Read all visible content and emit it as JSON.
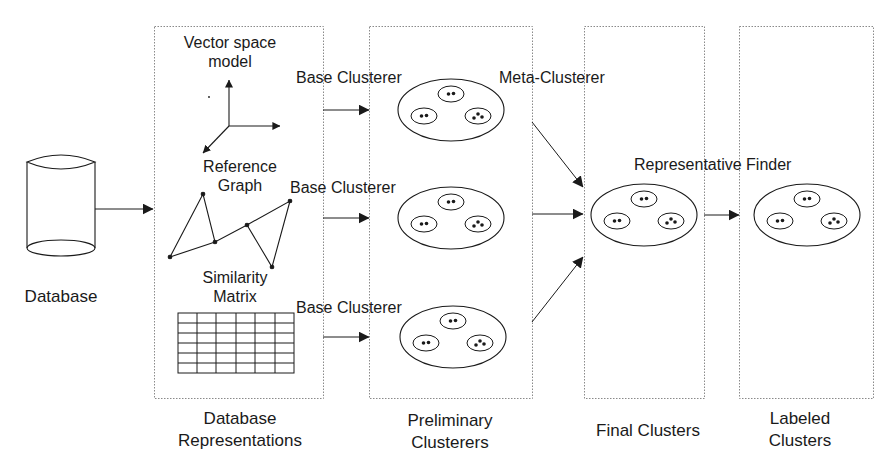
{
  "source": {
    "label": "Database",
    "icon": "database-cylinder-icon"
  },
  "stages": [
    {
      "id": "representations",
      "label_line1": "Database",
      "label_line2": "Representations",
      "items": [
        {
          "label_line1": "Vector space",
          "label_line2": "model",
          "icon": "3d-axes-icon"
        },
        {
          "label_line1": "Reference",
          "label_line2": "Graph",
          "icon": "graph-icon"
        },
        {
          "label_line1": "Similarity",
          "label_line2": "Matrix",
          "icon": "matrix-grid-icon"
        }
      ]
    },
    {
      "id": "preliminary",
      "label_line1": "Preliminary",
      "label_line2": "Clusterers",
      "cluster_groups": 3
    },
    {
      "id": "final",
      "label_line1": "Final Clusters",
      "label_line2": "",
      "cluster_groups": 1
    },
    {
      "id": "labeled",
      "label_line1": "Labeled",
      "label_line2": "Clusters",
      "cluster_groups": 1
    }
  ],
  "edges": {
    "base_clusterer": "Base Clusterer",
    "meta_clusterer": "Meta-Clusterer",
    "representative_finder": "Representative Finder"
  },
  "colors": {
    "stroke": "#1a1a1a",
    "box_border": "#8a8a8a",
    "background": "#ffffff"
  }
}
